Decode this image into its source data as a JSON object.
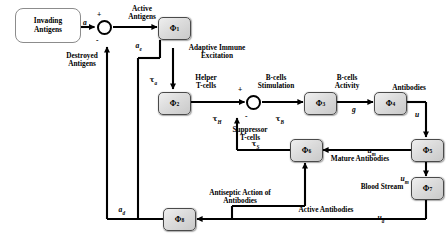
{
  "diagram": {
    "source_block": {
      "line1": "Invading",
      "line2": "Antigens"
    },
    "blocks": [
      {
        "id": "phi1",
        "label": "Φ",
        "sub": "1"
      },
      {
        "id": "phi2",
        "label": "Φ",
        "sub": "2"
      },
      {
        "id": "phi3",
        "label": "Φ",
        "sub": "3"
      },
      {
        "id": "phi4",
        "label": "Φ",
        "sub": "4"
      },
      {
        "id": "phi5",
        "label": "Φ",
        "sub": "5"
      },
      {
        "id": "phi6",
        "label": "Φ",
        "sub": "6"
      },
      {
        "id": "phi7",
        "label": "Φ",
        "sub": "7"
      },
      {
        "id": "phi8",
        "label": "Φ",
        "sub": "8"
      }
    ],
    "labels": {
      "active_antigens": "Active\nAntigens",
      "destroyed_antigens": "Destroyed\nAntigens",
      "adaptive_immune_excitation": "Adaptive Immune\nExcitation",
      "helper_tcells": "Helper\nT-cells",
      "suppressor_tcells": "Suppressor\nT-cells",
      "bcells_stimulation": "B-cells\nStimulation",
      "bcells_activity": "B-cells\nActivity",
      "antibodies": "Antibodies",
      "mature_antibodies": "Mature Antibodies",
      "blood_stream": "Blood Stream",
      "active_antibodies": "Active Antibodies",
      "antiseptic_action": "Antiseptic Action of\nAntibodies"
    },
    "signals": {
      "a": "a",
      "a_e": "a",
      "a_e_sub": "e",
      "a_d": "a",
      "a_d_sub": "d",
      "a_a": "u",
      "a_a_sub": "a",
      "tau_a": "τ",
      "tau_a_sub": "a",
      "tau_H": "τ",
      "tau_H_sub": "H",
      "tau_B": "τ",
      "tau_B_sub": "B",
      "tau_S": "τ",
      "tau_S_sub": "S",
      "g": "g",
      "u": "u",
      "u_m_right": "u",
      "u_m_right_sub": "m",
      "u_m_left": "u",
      "u_m_left_sub": "m"
    },
    "signs": {
      "sum1_plus": "+",
      "sum1_minus": "-",
      "sum2_plus": "+",
      "sum2_minus": "-"
    },
    "colors": {
      "line": "#000000",
      "block_border": "#4a4a4a",
      "block_fill": "#dcdcdc",
      "source_border": "#8c8c8c",
      "background": "#ffffff"
    }
  }
}
